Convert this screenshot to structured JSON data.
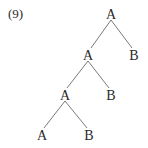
{
  "example": {
    "label": "(9)"
  },
  "tree": {
    "nodes": [
      {
        "id": "n0",
        "label": "A",
        "x": 111,
        "y": 8
      },
      {
        "id": "n1",
        "label": "A",
        "x": 88,
        "y": 49
      },
      {
        "id": "n2",
        "label": "B",
        "x": 134,
        "y": 49
      },
      {
        "id": "n3",
        "label": "A",
        "x": 65,
        "y": 89
      },
      {
        "id": "n4",
        "label": "B",
        "x": 111,
        "y": 89
      },
      {
        "id": "n5",
        "label": "A",
        "x": 42,
        "y": 129
      },
      {
        "id": "n6",
        "label": "B",
        "x": 89,
        "y": 129
      }
    ],
    "edges": [
      {
        "from": "n0",
        "to": "n1"
      },
      {
        "from": "n0",
        "to": "n2"
      },
      {
        "from": "n1",
        "to": "n3"
      },
      {
        "from": "n1",
        "to": "n4"
      },
      {
        "from": "n3",
        "to": "n5"
      },
      {
        "from": "n3",
        "to": "n6"
      }
    ],
    "colors": {
      "text": "#2a2a2a",
      "edge": "#6a6a6a"
    }
  }
}
